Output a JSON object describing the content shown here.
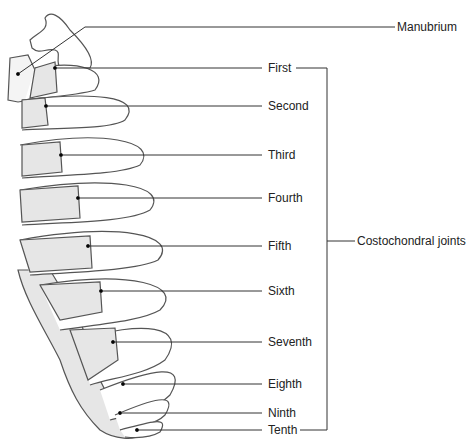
{
  "diagram": {
    "colors": {
      "bone": "#ffffff",
      "cartilage": "#e6e6e6",
      "outline": "#555555",
      "leader": "#333333"
    },
    "labels": {
      "manubrium": "Manubrium",
      "group": "Costochondral joints",
      "joints": [
        {
          "name": "First",
          "y": 68
        },
        {
          "name": "Second",
          "y": 106
        },
        {
          "name": "Third",
          "y": 155
        },
        {
          "name": "Fourth",
          "y": 198
        },
        {
          "name": "Fifth",
          "y": 246
        },
        {
          "name": "Sixth",
          "y": 291
        },
        {
          "name": "Seventh",
          "y": 342
        },
        {
          "name": "Eighth",
          "y": 384
        },
        {
          "name": "Ninth",
          "y": 413
        },
        {
          "name": "Tenth",
          "y": 430
        }
      ]
    }
  }
}
